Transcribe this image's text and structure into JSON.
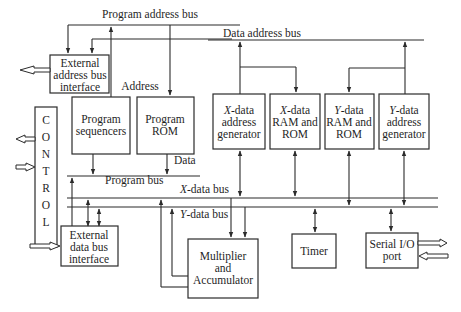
{
  "diagram": {
    "buses": {
      "program_address_bus": "Program address bus",
      "data_address_bus": "Data address bus",
      "program_bus": "Program bus",
      "x_data_bus_prefix": "X",
      "x_data_bus_suffix": "-data bus",
      "y_data_bus_prefix": "Y",
      "y_data_bus_suffix": "-data bus"
    },
    "labels": {
      "address": "Address",
      "data": "Data"
    },
    "blocks": {
      "external_address_bus_interface": [
        "External",
        "address bus",
        "interface"
      ],
      "program_sequencers": [
        "Program",
        "sequencers"
      ],
      "program_rom": [
        "Program",
        "ROM"
      ],
      "control": [
        "C",
        "O",
        "N",
        "T",
        "R",
        "O",
        "L"
      ],
      "x_data_address_generator": {
        "prefix": "X",
        "lines": [
          "-data",
          "address",
          "generator"
        ]
      },
      "x_data_ram_rom": {
        "prefix": "X",
        "lines": [
          "-data",
          "RAM and",
          "ROM"
        ]
      },
      "y_data_ram_rom": {
        "prefix": "Y",
        "lines": [
          "-data",
          "RAM and",
          "ROM"
        ]
      },
      "y_data_address_generator": {
        "prefix": "Y",
        "lines": [
          "-data",
          "address",
          "generator"
        ]
      },
      "external_data_bus_interface": [
        "External",
        "data bus",
        "interface"
      ],
      "multiplier_accumulator": [
        "Multiplier",
        "and",
        "Accumulator"
      ],
      "timer": [
        "Timer"
      ],
      "serial_io_port": [
        "Serial I/O",
        "port"
      ]
    }
  }
}
